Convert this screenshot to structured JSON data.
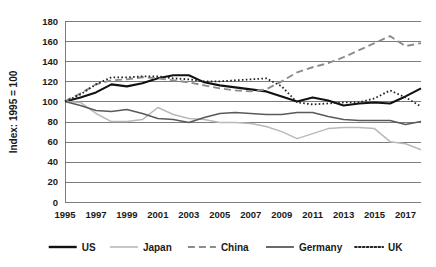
{
  "chart_data": {
    "type": "line",
    "title": "",
    "xlabel": "",
    "ylabel": "Index: 1995 = 100",
    "ylim": [
      0,
      180
    ],
    "ytick_step": 20,
    "yticks": [
      0,
      20,
      40,
      60,
      80,
      100,
      120,
      140,
      160,
      180
    ],
    "grid": true,
    "legend_position": "bottom",
    "x": [
      1995,
      1996,
      1997,
      1998,
      1999,
      2000,
      2001,
      2002,
      2003,
      2004,
      2005,
      2006,
      2007,
      2008,
      2009,
      2010,
      2011,
      2012,
      2013,
      2014,
      2015,
      2016,
      2017,
      2018
    ],
    "xticks": [
      1995,
      1997,
      1999,
      2001,
      2003,
      2005,
      2007,
      2009,
      2011,
      2013,
      2015,
      2017
    ],
    "xtick_labels": [
      "1995",
      "1997",
      "1999",
      "2001",
      "2003",
      "2005",
      "2007",
      "2009",
      "2011",
      "2013",
      "2015",
      "2017"
    ],
    "series": [
      {
        "name": "US",
        "color": "#111111",
        "width": 2.1,
        "dash": "none",
        "values": [
          100,
          104,
          109,
          117,
          115,
          118,
          123,
          126,
          126,
          119,
          116,
          114,
          112,
          110,
          105,
          100,
          104,
          101,
          96,
          98,
          99,
          98,
          105,
          113
        ]
      },
      {
        "name": "Japan",
        "color": "#b9b9b9",
        "width": 1.5,
        "dash": "none",
        "values": [
          100,
          99,
          88,
          80,
          80,
          82,
          94,
          87,
          83,
          82,
          79,
          79,
          78,
          75,
          70,
          63,
          68,
          73,
          74,
          74,
          73,
          60,
          58,
          52
        ]
      },
      {
        "name": "China",
        "color": "#8c8c8c",
        "width": 1.9,
        "dash": "7,4",
        "values": [
          100,
          108,
          117,
          121,
          122,
          124,
          123,
          121,
          119,
          116,
          113,
          111,
          110,
          112,
          120,
          129,
          134,
          138,
          144,
          151,
          158,
          165,
          155,
          158
        ]
      },
      {
        "name": "Germany",
        "color": "#5a5a5a",
        "width": 1.6,
        "dash": "none",
        "values": [
          100,
          96,
          91,
          90,
          92,
          88,
          83,
          82,
          79,
          84,
          88,
          89,
          88,
          87,
          87,
          89,
          89,
          85,
          82,
          81,
          81,
          81,
          77,
          80
        ]
      },
      {
        "name": "UK",
        "color": "#222222",
        "width": 1.8,
        "dash": "1.6,2.3",
        "values": [
          100,
          107,
          117,
          124,
          124,
          125,
          125,
          123,
          122,
          120,
          120,
          121,
          122,
          123,
          115,
          99,
          97,
          98,
          99,
          99,
          103,
          111,
          104,
          95
        ]
      }
    ],
    "legend": [
      {
        "label": "US",
        "color": "#111111",
        "dash": "none",
        "width": 2.4
      },
      {
        "label": "Japan",
        "color": "#b9b9b9",
        "dash": "none",
        "width": 1.6
      },
      {
        "label": "China",
        "color": "#8c8c8c",
        "dash": "7,4",
        "width": 2.0
      },
      {
        "label": "Germany",
        "color": "#5a5a5a",
        "dash": "none",
        "width": 1.8
      },
      {
        "label": "UK",
        "color": "#222222",
        "dash": "1.6,2.3",
        "width": 2.0
      }
    ]
  }
}
